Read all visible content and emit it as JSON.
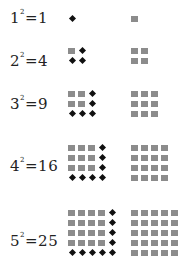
{
  "rows": [
    {
      "base": "1",
      "exp": "2",
      "result": "1",
      "n": 1,
      "label_top": 8,
      "grid_top": 16
    },
    {
      "base": "2",
      "exp": "2",
      "result": "4",
      "n": 2,
      "label_top": 51,
      "grid_top": 48
    },
    {
      "base": "3",
      "exp": "2",
      "result": "9",
      "n": 3,
      "label_top": 94,
      "grid_top": 91
    },
    {
      "base": "4",
      "exp": "2",
      "result": "16",
      "n": 4,
      "label_top": 156,
      "grid_top": 145
    },
    {
      "base": "5",
      "exp": "2",
      "result": "25",
      "n": 5,
      "label_top": 231,
      "grid_top": 210
    }
  ],
  "layout": {
    "left_grid_x": 68,
    "right_grid_x": 131,
    "spacing": 10
  },
  "colors": {
    "square": "#8c8c8c",
    "dot": "#111111",
    "text": "#222222"
  },
  "legend": {
    "left_column": "previous square plus added dots (gnomon)",
    "right_column": "completed square"
  }
}
